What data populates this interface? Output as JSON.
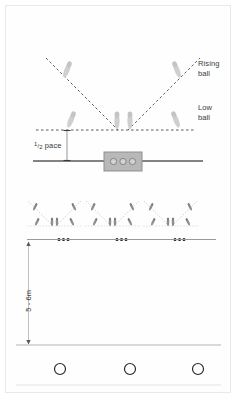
{
  "diagram": {
    "labels": {
      "rising_ball": "Rising\nball",
      "low_ball": "Low\nball",
      "half_pace_numerator": "1",
      "half_pace_denominator": "2",
      "half_pace_word": "pace",
      "depth": "5 - 6m"
    },
    "colors": {
      "figure_fill": "#c9c9c9",
      "figure_fill_light": "#d6d6d6",
      "dashed_line": "#555555",
      "solid_line": "#555555",
      "net_box_fill": "#b8b8b8",
      "net_box_stroke": "#8f8f8f",
      "ball_dot": "#1c1c1c",
      "circle_stroke": "#2a2a2a",
      "text": "#3a3a3a",
      "frame_border": "#e9e9e9",
      "background": "#ffffff",
      "mini_line": "#bfbfbf",
      "mini_figure": "#8a8a8a"
    },
    "top_section": {
      "baseline_y": 130,
      "rising_figures_count": 2,
      "low_figures_count": 2,
      "center_figures_count": 2,
      "dashed_v_lines": 2
    },
    "net_section": {
      "net_circles_count": 3,
      "net_box": {
        "x": 104,
        "y": 152,
        "w": 38,
        "h": 19
      }
    },
    "middle_section": {
      "repeat_units": 3,
      "dots_per_unit": 3
    },
    "bottom_section": {
      "target_circles_count": 3,
      "circle_radius": 5.5
    }
  }
}
